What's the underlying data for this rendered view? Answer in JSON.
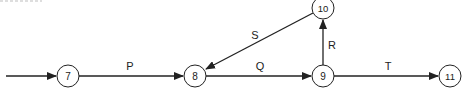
{
  "diagram": {
    "type": "activity-network",
    "colors": {
      "line": "#222222",
      "node_fill": "#ffffff",
      "text": "#222222",
      "background": "#ffffff"
    },
    "nodes": [
      {
        "id": "7",
        "label": "7",
        "x": 68,
        "y": 76
      },
      {
        "id": "8",
        "label": "8",
        "x": 195,
        "y": 76
      },
      {
        "id": "9",
        "label": "9",
        "x": 323,
        "y": 76
      },
      {
        "id": "10",
        "label": "10",
        "x": 323,
        "y": 8
      },
      {
        "id": "11",
        "label": "11",
        "x": 450,
        "y": 76
      }
    ],
    "edges": [
      {
        "from": "start",
        "to": "7",
        "label": ""
      },
      {
        "from": "7",
        "to": "8",
        "label": "P"
      },
      {
        "from": "8",
        "to": "9",
        "label": "Q"
      },
      {
        "from": "9",
        "to": "10",
        "label": "R"
      },
      {
        "from": "10",
        "to": "8",
        "label": "S"
      },
      {
        "from": "9",
        "to": "11",
        "label": "T"
      }
    ]
  }
}
